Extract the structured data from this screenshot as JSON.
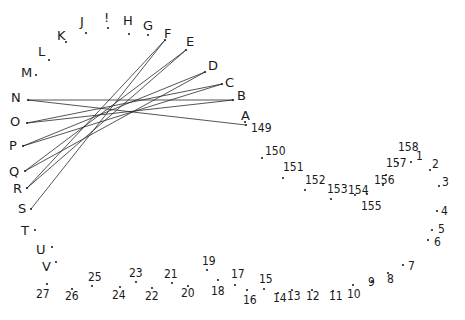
{
  "puzzle": {
    "type": "connect-the-dots",
    "ink_color": "#1a1a1a",
    "background": "#ffffff",
    "letter_points": [
      "A",
      "B",
      "C",
      "D",
      "E",
      "F",
      "G",
      "H",
      "!",
      "J",
      "K",
      "L",
      "M",
      "N",
      "O",
      "P",
      "Q",
      "R",
      "S",
      "T",
      "U",
      "V"
    ],
    "number_points_low": [
      "1",
      "2",
      "3",
      "4",
      "5",
      "6",
      "7",
      "8",
      "9",
      "10",
      "11",
      "12",
      "13",
      "14",
      "15",
      "16",
      "17",
      "18",
      "19",
      "20",
      "21",
      "22",
      "23",
      "24",
      "25",
      "26",
      "27"
    ],
    "number_points_high": [
      "149",
      "150",
      "151",
      "152",
      "153",
      "154",
      "155",
      "156",
      "157",
      "158"
    ],
    "drawn_lines": [
      {
        "from": "N",
        "to": "B"
      },
      {
        "from": "N",
        "to": "149"
      },
      {
        "from": "O",
        "to": "C"
      },
      {
        "from": "O",
        "to": "B"
      },
      {
        "from": "P",
        "to": "D"
      },
      {
        "from": "P",
        "to": "C"
      },
      {
        "from": "Q",
        "to": "E"
      },
      {
        "from": "Q",
        "to": "D"
      },
      {
        "from": "R",
        "to": "F"
      },
      {
        "from": "R",
        "to": "E"
      },
      {
        "from": "S",
        "to": "F"
      }
    ]
  }
}
